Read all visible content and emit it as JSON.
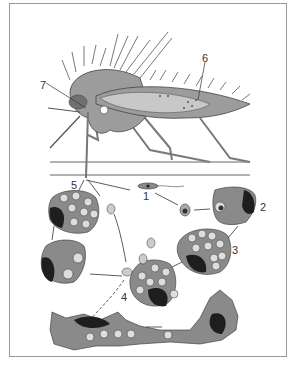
{
  "figure": {
    "labels": [
      {
        "id": "1",
        "text": "1",
        "x": 143,
        "y": 191
      },
      {
        "id": "2",
        "text": "2",
        "x": 260,
        "y": 202
      },
      {
        "id": "3",
        "text": "3",
        "x": 232,
        "y": 245
      },
      {
        "id": "4",
        "text": "4",
        "x": 121,
        "y": 292
      },
      {
        "id": "5",
        "text": "5",
        "x": 71,
        "y": 180
      },
      {
        "id": "6",
        "text": "6",
        "x": 202,
        "y": 53
      },
      {
        "id": "7",
        "text": "7",
        "x": 40,
        "y": 80
      }
    ],
    "colors": {
      "cell_fill": "#8a8a8a",
      "nucleus": "#1e1e1e",
      "mosquito_body": "#9c9c9c",
      "midgut": "#c8c8c8",
      "frame_border": "#9a9a9a",
      "background": "#ffffff"
    }
  }
}
